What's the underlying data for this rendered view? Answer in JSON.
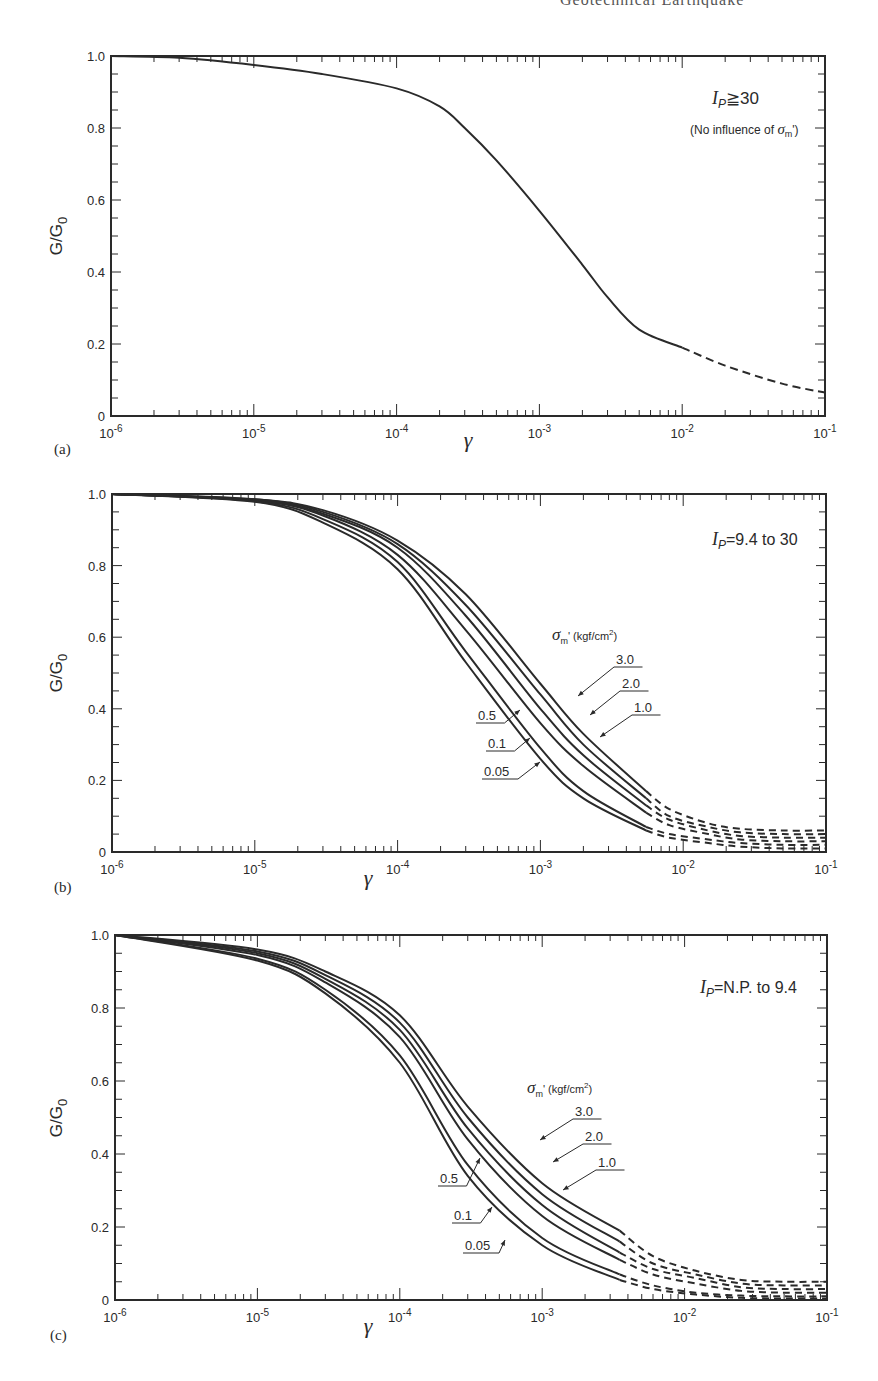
{
  "page": {
    "header_fragment": "Geotechnical Earthquake"
  },
  "chart_data": [
    {
      "id": "a",
      "type": "line",
      "panel_label": "(a)",
      "title": "",
      "annotation": "I_P ≧ 30",
      "annotation_ip": "I",
      "annotation_ip_sub": "P",
      "annotation_rest": "≧30",
      "subannotation": "(No influence of σm')",
      "subannotation_pre": "(No influence of ",
      "subannotation_sigma": "σ",
      "subannotation_sub": "m",
      "subannotation_post": "')",
      "xlabel": "γ",
      "ylabel": "G/G0",
      "ylabel_main": "G/G",
      "ylabel_sub": "0",
      "xscale": "log",
      "xlim": [
        1e-06,
        0.1
      ],
      "ylim": [
        0,
        1.0
      ],
      "x_tick_labels": [
        "10-6",
        "10-5",
        "10-4",
        "10-3",
        "10-2",
        "10-1"
      ],
      "y_tick_labels": [
        "0",
        "0.2",
        "0.4",
        "0.6",
        "0.8",
        "1.0"
      ],
      "grid": false,
      "series": [
        {
          "name": "I_P >= 30",
          "x": [
            1e-06,
            3e-06,
            1e-05,
            3e-05,
            0.0001,
            0.0002,
            0.0003,
            0.0005,
            0.001,
            0.002,
            0.003,
            0.005,
            0.01
          ],
          "y": [
            1.0,
            0.995,
            0.975,
            0.95,
            0.91,
            0.86,
            0.8,
            0.71,
            0.57,
            0.42,
            0.33,
            0.24,
            0.19
          ],
          "style": "solid"
        },
        {
          "name": "I_P >= 30 (extrapolated)",
          "x": [
            0.01,
            0.02,
            0.05,
            0.1
          ],
          "y": [
            0.19,
            0.14,
            0.09,
            0.065
          ],
          "style": "dashed"
        }
      ]
    },
    {
      "id": "b",
      "type": "line",
      "panel_label": "(b)",
      "annotation": "I_P = 9.4 to 30",
      "annotation_ip": "I",
      "annotation_ip_sub": "P",
      "annotation_rest": "=9.4 to 30",
      "legend_title": "σm' (kgf/cm²)",
      "legend_title_sigma": "σ",
      "legend_title_sub": "m",
      "legend_title_post": "' (kgf/cm",
      "legend_title_sup": "2",
      "legend_title_end": ")",
      "xlabel": "γ",
      "ylabel": "G/G0",
      "ylabel_main": "G/G",
      "ylabel_sub": "0",
      "xscale": "log",
      "xlim": [
        1e-06,
        0.1
      ],
      "ylim": [
        0,
        1.0
      ],
      "x_tick_labels": [
        "10-6",
        "10-5",
        "10-4",
        "10-3",
        "10-2",
        "10-1"
      ],
      "y_tick_labels": [
        "0",
        "0.2",
        "0.4",
        "0.6",
        "0.8",
        "1.0"
      ],
      "grid": false,
      "series_labels": [
        "3.0",
        "2.0",
        "1.0",
        "0.5",
        "0.1",
        "0.05"
      ],
      "series": [
        {
          "name": "3.0",
          "x": [
            1e-06,
            1e-05,
            3e-05,
            0.0001,
            0.0003,
            0.001,
            0.002,
            0.0055
          ],
          "y": [
            1.0,
            0.985,
            0.955,
            0.87,
            0.72,
            0.47,
            0.33,
            0.17
          ],
          "ext_y": [
            0.17,
            0.12,
            0.08,
            0.065,
            0.06,
            0.06
          ],
          "ext_x": [
            0.0055,
            0.008,
            0.015,
            0.025,
            0.05,
            0.1
          ]
        },
        {
          "name": "2.0",
          "x": [
            1e-06,
            1e-05,
            3e-05,
            0.0001,
            0.0003,
            0.001,
            0.002,
            0.0055
          ],
          "y": [
            1.0,
            0.985,
            0.95,
            0.86,
            0.69,
            0.44,
            0.3,
            0.15
          ],
          "ext_y": [
            0.15,
            0.1,
            0.07,
            0.055,
            0.05,
            0.05
          ],
          "ext_x": [
            0.0055,
            0.008,
            0.015,
            0.025,
            0.05,
            0.1
          ]
        },
        {
          "name": "1.0",
          "x": [
            1e-06,
            1e-05,
            3e-05,
            0.0001,
            0.0003,
            0.001,
            0.002,
            0.0055
          ],
          "y": [
            1.0,
            0.983,
            0.945,
            0.85,
            0.66,
            0.4,
            0.27,
            0.13
          ],
          "ext_y": [
            0.13,
            0.09,
            0.06,
            0.045,
            0.04,
            0.04
          ],
          "ext_x": [
            0.0055,
            0.008,
            0.015,
            0.025,
            0.05,
            0.1
          ]
        },
        {
          "name": "0.5",
          "x": [
            1e-06,
            1e-05,
            3e-05,
            0.0001,
            0.0003,
            0.001,
            0.002,
            0.0055
          ],
          "y": [
            1.0,
            0.982,
            0.94,
            0.83,
            0.62,
            0.36,
            0.24,
            0.11
          ],
          "ext_y": [
            0.11,
            0.075,
            0.05,
            0.035,
            0.03,
            0.03
          ],
          "ext_x": [
            0.0055,
            0.008,
            0.015,
            0.025,
            0.05,
            0.1
          ]
        },
        {
          "name": "0.1",
          "x": [
            1e-06,
            1e-05,
            3e-05,
            0.0001,
            0.0003,
            0.001,
            0.002,
            0.0055
          ],
          "y": [
            1.0,
            0.98,
            0.93,
            0.81,
            0.56,
            0.29,
            0.17,
            0.07
          ],
          "ext_y": [
            0.07,
            0.05,
            0.035,
            0.025,
            0.02,
            0.02
          ],
          "ext_x": [
            0.0055,
            0.008,
            0.015,
            0.025,
            0.05,
            0.1
          ]
        },
        {
          "name": "0.05",
          "x": [
            1e-06,
            1e-05,
            3e-05,
            0.0001,
            0.0003,
            0.001,
            0.002,
            0.0055
          ],
          "y": [
            1.0,
            0.978,
            0.92,
            0.79,
            0.53,
            0.26,
            0.15,
            0.06
          ],
          "ext_y": [
            0.06,
            0.04,
            0.025,
            0.015,
            0.01,
            0.01
          ],
          "ext_x": [
            0.0055,
            0.008,
            0.015,
            0.025,
            0.05,
            0.1
          ]
        }
      ]
    },
    {
      "id": "c",
      "type": "line",
      "panel_label": "(c)",
      "annotation": "I_P = N.P. to 9.4",
      "annotation_ip": "I",
      "annotation_ip_sub": "P",
      "annotation_rest": "=N.P. to 9.4",
      "legend_title": "σm' (kgf/cm²)",
      "legend_title_sigma": "σ",
      "legend_title_sub": "m",
      "legend_title_post": "' (kgf/cm",
      "legend_title_sup": "2",
      "legend_title_end": ")",
      "xlabel": "γ",
      "ylabel": "G/G0",
      "ylabel_main": "G/G",
      "ylabel_sub": "0",
      "xscale": "log",
      "xlim": [
        1e-06,
        0.1
      ],
      "ylim": [
        0,
        1.0
      ],
      "x_tick_labels": [
        "10-6",
        "10-5",
        "10-4",
        "10-3",
        "10-2",
        "10-1"
      ],
      "y_tick_labels": [
        "0",
        "0.2",
        "0.4",
        "0.6",
        "0.8",
        "1.0"
      ],
      "grid": false,
      "series_labels": [
        "3.0",
        "2.0",
        "1.0",
        "0.5",
        "0.1",
        "0.05"
      ],
      "series": [
        {
          "name": "3.0",
          "x": [
            1e-06,
            1e-05,
            3e-05,
            0.0001,
            0.0003,
            0.001,
            0.0035
          ],
          "y": [
            1.0,
            0.96,
            0.9,
            0.78,
            0.53,
            0.32,
            0.19
          ],
          "ext_y": [
            0.19,
            0.12,
            0.08,
            0.055,
            0.05,
            0.05
          ],
          "ext_x": [
            0.0035,
            0.006,
            0.012,
            0.025,
            0.05,
            0.1
          ]
        },
        {
          "name": "2.0",
          "x": [
            1e-06,
            1e-05,
            3e-05,
            0.0001,
            0.0003,
            0.001,
            0.0035
          ],
          "y": [
            1.0,
            0.955,
            0.89,
            0.76,
            0.5,
            0.29,
            0.16
          ],
          "ext_y": [
            0.16,
            0.1,
            0.07,
            0.045,
            0.04,
            0.04
          ],
          "ext_x": [
            0.0035,
            0.006,
            0.012,
            0.025,
            0.05,
            0.1
          ]
        },
        {
          "name": "1.0",
          "x": [
            1e-06,
            1e-05,
            3e-05,
            0.0001,
            0.0003,
            0.001,
            0.0035
          ],
          "y": [
            1.0,
            0.95,
            0.88,
            0.74,
            0.47,
            0.26,
            0.13
          ],
          "ext_y": [
            0.13,
            0.085,
            0.06,
            0.035,
            0.03,
            0.03
          ],
          "ext_x": [
            0.0035,
            0.006,
            0.012,
            0.025,
            0.05,
            0.1
          ]
        },
        {
          "name": "0.5",
          "x": [
            1e-06,
            1e-05,
            3e-05,
            0.0001,
            0.0003,
            0.001,
            0.0035
          ],
          "y": [
            1.0,
            0.945,
            0.87,
            0.72,
            0.44,
            0.23,
            0.11
          ],
          "ext_y": [
            0.11,
            0.07,
            0.045,
            0.025,
            0.02,
            0.02
          ],
          "ext_x": [
            0.0035,
            0.006,
            0.012,
            0.025,
            0.05,
            0.1
          ]
        },
        {
          "name": "0.1",
          "x": [
            1e-06,
            1e-05,
            3e-05,
            0.0001,
            0.0003,
            0.001,
            0.0035
          ],
          "y": [
            1.0,
            0.935,
            0.85,
            0.67,
            0.37,
            0.17,
            0.07
          ],
          "ext_y": [
            0.07,
            0.04,
            0.02,
            0.012,
            0.01,
            0.01
          ],
          "ext_x": [
            0.0035,
            0.006,
            0.012,
            0.025,
            0.05,
            0.1
          ]
        },
        {
          "name": "0.05",
          "x": [
            1e-06,
            1e-05,
            3e-05,
            0.0001,
            0.0003,
            0.001,
            0.0035
          ],
          "y": [
            1.0,
            0.93,
            0.84,
            0.65,
            0.34,
            0.15,
            0.055
          ],
          "ext_y": [
            0.055,
            0.03,
            0.015,
            0.006,
            0.004,
            0.004
          ],
          "ext_x": [
            0.0035,
            0.006,
            0.012,
            0.025,
            0.05,
            0.1
          ]
        }
      ]
    }
  ]
}
